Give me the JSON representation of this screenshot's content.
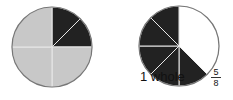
{
  "figure": {
    "circles": [
      {
        "name": "whole-circle",
        "cx": 52,
        "cy": 47,
        "r": 40,
        "sectors": [
          {
            "from_deg": 0,
            "to_deg": 45,
            "fill": "#222222"
          },
          {
            "from_deg": 45,
            "to_deg": 90,
            "fill": "#222222"
          },
          {
            "from_deg": 90,
            "to_deg": 180,
            "fill": "#c8c8c8"
          },
          {
            "from_deg": 180,
            "to_deg": 270,
            "fill": "#c8c8c8"
          },
          {
            "from_deg": 270,
            "to_deg": 360,
            "fill": "#c8c8c8"
          }
        ]
      },
      {
        "name": "five-eighths-circle",
        "cx": 179,
        "cy": 46,
        "r": 40,
        "sectors": [
          {
            "from_deg": 0,
            "to_deg": 135,
            "fill": "#ffffff"
          },
          {
            "from_deg": 135,
            "to_deg": 180,
            "fill": "#222222"
          },
          {
            "from_deg": 180,
            "to_deg": 225,
            "fill": "#222222"
          },
          {
            "from_deg": 225,
            "to_deg": 270,
            "fill": "#222222"
          },
          {
            "from_deg": 270,
            "to_deg": 315,
            "fill": "#222222"
          },
          {
            "from_deg": 315,
            "to_deg": 360,
            "fill": "#222222"
          }
        ]
      }
    ],
    "labels": {
      "whole": "1 whole",
      "fraction_numerator": "5",
      "fraction_denominator": "8"
    },
    "colors": {
      "dark": "#222222",
      "light": "#c8c8c8",
      "divider": "#e8e8e8",
      "outline": "#777777"
    }
  }
}
